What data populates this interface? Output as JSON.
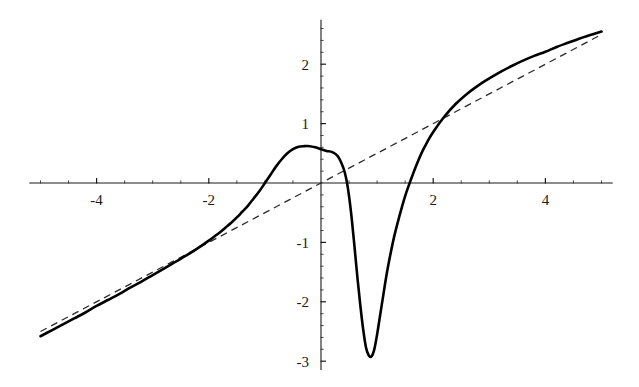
{
  "chart_data": {
    "type": "line",
    "title": "",
    "subtitle": "",
    "xlabel": "",
    "ylabel": "",
    "xlim": [
      -5.2,
      5.2
    ],
    "ylim": [
      -3.15,
      2.75
    ],
    "grid": false,
    "legend": "none",
    "background_color": "#ffffff",
    "axis_color": "#1a1a1a",
    "x_tick_labels": [
      "-4",
      "-2",
      "2",
      "4"
    ],
    "x_tick_values": [
      -4,
      -2,
      2,
      4
    ],
    "y_tick_labels": [
      "2",
      "1",
      "-1",
      "-2",
      "-3"
    ],
    "y_tick_values": [
      2,
      1,
      -1,
      -2,
      -3
    ],
    "x_minor_step": 0.5,
    "y_minor_step": 0.2,
    "annotations": {
      "local_maximum": {
        "x": 0.21,
        "y": 0.62
      },
      "global_minimum": {
        "x": 0.82,
        "y": -2.92
      },
      "zero_crossing_left": {
        "x": -0.5,
        "y": 0
      },
      "zero_crossing_right": {
        "x": 1.37,
        "y": 0
      }
    },
    "series": [
      {
        "name": "function",
        "style": "solid",
        "color": "#000000",
        "x": [
          -5.0,
          -4.8,
          -4.6,
          -4.4,
          -4.2,
          -4.0,
          -3.8,
          -3.6,
          -3.4,
          -3.2,
          -3.0,
          -2.8,
          -2.6,
          -2.4,
          -2.2,
          -2.0,
          -1.9,
          -1.8,
          -1.7,
          -1.6,
          -1.5,
          -1.4,
          -1.3,
          -1.2,
          -1.1,
          -1.0,
          -0.9,
          -0.8,
          -0.7,
          -0.6,
          -0.5,
          -0.4,
          -0.3,
          -0.2,
          -0.1,
          0.0,
          0.1,
          0.2,
          0.3,
          0.4,
          0.45,
          0.5,
          0.55,
          0.6,
          0.65,
          0.7,
          0.75,
          0.8,
          0.85,
          0.9,
          0.95,
          1.0,
          1.05,
          1.1,
          1.15,
          1.2,
          1.3,
          1.4,
          1.5,
          1.6,
          1.7,
          1.8,
          1.9,
          2.0,
          2.2,
          2.4,
          2.6,
          2.8,
          3.0,
          3.2,
          3.4,
          3.6,
          3.8,
          4.0,
          4.2,
          4.4,
          4.6,
          4.8,
          5.0
        ],
        "y": [
          -2.58,
          -2.48,
          -2.38,
          -2.28,
          -2.18,
          -2.07,
          -1.97,
          -1.87,
          -1.76,
          -1.66,
          -1.55,
          -1.44,
          -1.33,
          -1.22,
          -1.1,
          -0.97,
          -0.9,
          -0.83,
          -0.75,
          -0.67,
          -0.58,
          -0.48,
          -0.38,
          -0.26,
          -0.14,
          0.0,
          0.14,
          0.28,
          0.4,
          0.5,
          0.57,
          0.61,
          0.62,
          0.62,
          0.6,
          0.57,
          0.54,
          0.52,
          0.45,
          0.25,
          0.07,
          -0.22,
          -0.62,
          -1.1,
          -1.6,
          -2.05,
          -2.45,
          -2.76,
          -2.9,
          -2.92,
          -2.8,
          -2.55,
          -2.25,
          -1.95,
          -1.65,
          -1.38,
          -0.92,
          -0.55,
          -0.22,
          0.05,
          0.3,
          0.52,
          0.7,
          0.86,
          1.12,
          1.33,
          1.5,
          1.64,
          1.76,
          1.87,
          1.97,
          2.06,
          2.14,
          2.21,
          2.29,
          2.36,
          2.43,
          2.49,
          2.55
        ]
      },
      {
        "name": "asymptote",
        "style": "dashed",
        "color": "#2b2b2b",
        "equation": "y = x / 2",
        "x": [
          -5.0,
          5.0
        ],
        "y": [
          -2.5,
          2.5
        ]
      }
    ]
  }
}
